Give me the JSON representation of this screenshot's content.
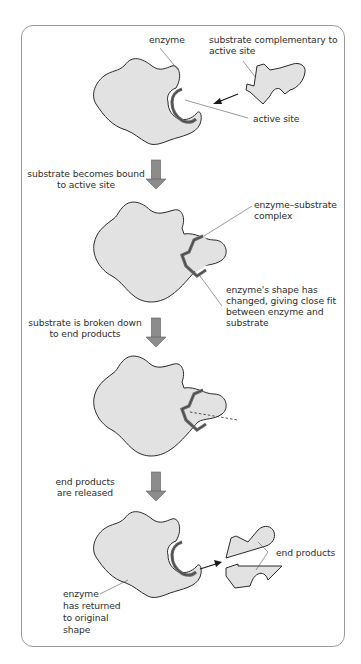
{
  "diagram": {
    "colors": {
      "enzyme_fill": "#e2e2e2",
      "outline": "#2a2a2a",
      "active_site_band": "#6a6a6a",
      "arrow_fill": "#8c8c8c",
      "frame": "#9a9a9a",
      "text": "#2e2e2e"
    },
    "stages": [
      {
        "id": "stage-1",
        "labels": {
          "enzyme": "enzyme",
          "substrate_line1": "substrate complementary to",
          "substrate_line2": "active site",
          "active_site": "active site"
        }
      },
      {
        "id": "stage-2",
        "step_line1": "substrate becomes bound",
        "step_line2": "to active site",
        "labels": {
          "complex_line1": "enzyme–substrate",
          "complex_line2": "complex",
          "shape_line1": "enzyme's shape has",
          "shape_line2": "changed, giving close fit",
          "shape_line3": "between enzyme and",
          "shape_line4": "substrate"
        }
      },
      {
        "id": "stage-3",
        "step_line1": "substrate is broken down",
        "step_line2": "to end products"
      },
      {
        "id": "stage-4",
        "step_line1": "end products",
        "step_line2": "are released",
        "labels": {
          "end_products": "end products",
          "returned_line1": "enzyme",
          "returned_line2": "has returned",
          "returned_line3": "to original",
          "returned_line4": "shape"
        }
      }
    ]
  }
}
